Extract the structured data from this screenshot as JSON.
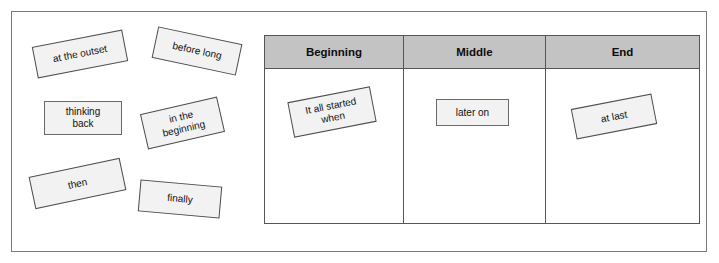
{
  "worksheet": {
    "title": "Sequencing words sorting activity",
    "frame_border_color": "#7b7b7b",
    "card_fill_color": "#f2f2f2",
    "card_border_color": "#4d4d4d",
    "header_fill_color": "#c3c3c3"
  },
  "word_bank": {
    "name": "unsorted-word-cards",
    "cards": [
      {
        "label": "at the outset",
        "rotation": -11
      },
      {
        "label": "before long",
        "rotation": 12
      },
      {
        "label": "thinking\nback",
        "rotation": 0
      },
      {
        "label": "in the\nbeginning",
        "rotation": -13
      },
      {
        "label": "then",
        "rotation": -12
      },
      {
        "label": "finally",
        "rotation": 5
      }
    ]
  },
  "table": {
    "name": "story-structure-table",
    "columns": [
      {
        "header": "Beginning",
        "cards": [
          {
            "label": "It all started\nwhen",
            "rotation": -11
          }
        ]
      },
      {
        "header": "Middle",
        "cards": [
          {
            "label": "later on",
            "rotation": 0
          }
        ]
      },
      {
        "header": "End",
        "cards": [
          {
            "label": "at last",
            "rotation": -11
          }
        ]
      }
    ]
  }
}
